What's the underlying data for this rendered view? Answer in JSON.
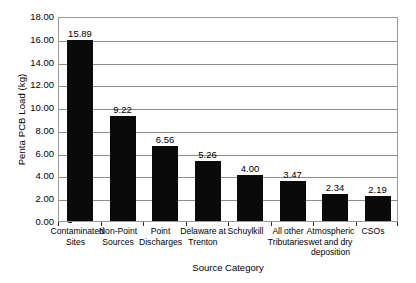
{
  "chart_data": {
    "type": "bar",
    "title": "",
    "xlabel": "Source Category",
    "ylabel": "Penta PCB Load (kg)",
    "ylim": [
      0,
      18
    ],
    "ytick_step": 2,
    "ytick_labels": [
      "0.00",
      "2.00",
      "4.00",
      "6.00",
      "8.00",
      "10.00",
      "12.00",
      "14.00",
      "16.00",
      "18.00"
    ],
    "ytick_values": [
      0,
      2,
      4,
      6,
      8,
      10,
      12,
      14,
      16,
      18
    ],
    "grid": "horizontal",
    "legend": "none",
    "bar_color": "#0a0a0a",
    "categories": [
      "Contaminated Sites",
      "Non-Point Sources",
      "Point Discharges",
      "Delaware at Trenton",
      "Schuylkill",
      "All other Tributaries",
      "Atmospheric wet and dry deposition",
      "CSOs"
    ],
    "values": [
      15.89,
      9.22,
      6.56,
      5.26,
      4.0,
      3.47,
      2.34,
      2.19
    ],
    "data_labels": [
      "15.89",
      "9.22",
      "6.56",
      "5.26",
      "4.00",
      "3.47",
      "2.34",
      "2.19"
    ]
  }
}
